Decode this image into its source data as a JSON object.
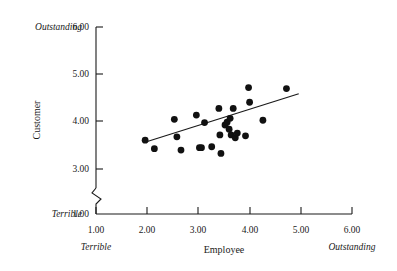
{
  "chart_data": {
    "type": "scatter",
    "title": "",
    "xlabel": "Employee",
    "ylabel": "Customer",
    "xlim": [
      1.0,
      6.0
    ],
    "ylim": [
      3.0,
      6.0
    ],
    "y_axis_break": true,
    "y_axis_break_between": [
      1.0,
      3.0
    ],
    "grid": false,
    "legend": false,
    "xticks": [
      "1.00",
      "2.00",
      "3.00",
      "4.00",
      "5.00",
      "6.00"
    ],
    "xtick_values": [
      1.0,
      2.0,
      3.0,
      4.0,
      5.0,
      6.0
    ],
    "yticks": [
      "1.00",
      "3.00",
      "4.00",
      "5.00",
      "6.00"
    ],
    "ytick_values": [
      1.0,
      3.0,
      4.0,
      5.0,
      6.0
    ],
    "x_low_anchor_label": "Terrible",
    "x_high_anchor_label": "Outstanding",
    "y_low_anchor_label": "Terrible",
    "y_high_anchor_label": "Outstanding",
    "points": [
      {
        "x": 1.96,
        "y": 3.61
      },
      {
        "x": 2.14,
        "y": 3.43
      },
      {
        "x": 2.53,
        "y": 4.05
      },
      {
        "x": 2.58,
        "y": 3.68
      },
      {
        "x": 2.66,
        "y": 3.4
      },
      {
        "x": 2.96,
        "y": 4.14
      },
      {
        "x": 3.02,
        "y": 3.45
      },
      {
        "x": 3.06,
        "y": 3.45
      },
      {
        "x": 3.12,
        "y": 3.98
      },
      {
        "x": 3.26,
        "y": 3.47
      },
      {
        "x": 3.4,
        "y": 4.28
      },
      {
        "x": 3.42,
        "y": 3.72
      },
      {
        "x": 3.44,
        "y": 3.33
      },
      {
        "x": 3.52,
        "y": 3.93
      },
      {
        "x": 3.56,
        "y": 3.99
      },
      {
        "x": 3.6,
        "y": 3.84
      },
      {
        "x": 3.62,
        "y": 4.07
      },
      {
        "x": 3.64,
        "y": 3.72
      },
      {
        "x": 3.68,
        "y": 4.28
      },
      {
        "x": 3.72,
        "y": 3.66
      },
      {
        "x": 3.76,
        "y": 3.76
      },
      {
        "x": 3.92,
        "y": 3.7
      },
      {
        "x": 3.98,
        "y": 4.72
      },
      {
        "x": 4.0,
        "y": 4.41
      },
      {
        "x": 4.26,
        "y": 4.03
      },
      {
        "x": 4.72,
        "y": 4.7
      }
    ],
    "fit_line": {
      "type": "linear-regression",
      "x_start": 1.94,
      "y_start": 3.56,
      "x_end": 4.96,
      "y_end": 4.59
    }
  }
}
